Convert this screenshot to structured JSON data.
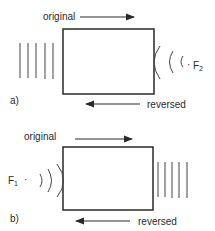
{
  "diagram": {
    "type": "phase-conjugation wavefront reversal",
    "panels": [
      {
        "id": "a",
        "label": "a)",
        "top_arrow_label": "original",
        "bottom_arrow_label": "reversed",
        "plane_waves_side": "left",
        "spherical_waves_side": "right",
        "source_label": "F",
        "source_subscript": "2",
        "source_dot": "·"
      },
      {
        "id": "b",
        "label": "b)",
        "top_arrow_label": "original",
        "bottom_arrow_label": "reversed",
        "plane_waves_side": "right",
        "spherical_waves_side": "left",
        "source_label": "F",
        "source_subscript": "1",
        "source_dot": "·"
      }
    ],
    "colors": {
      "line": "#2a2a2a",
      "background": "#ffffff"
    }
  }
}
